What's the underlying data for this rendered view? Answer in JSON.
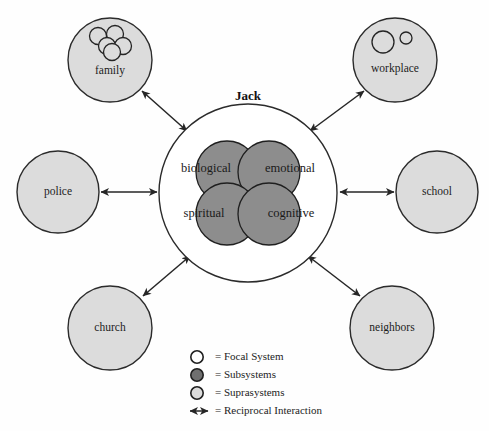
{
  "diagram": {
    "type": "ecomap",
    "focal": {
      "title": "Jack",
      "shape": "circle",
      "fill": "#ffffff",
      "cx": 248,
      "cy": 193,
      "r": 89
    },
    "subsystems": [
      {
        "label": "biological",
        "quadrant": "top-left",
        "cx": 227,
        "cy": 172,
        "r": 31,
        "label_x": 206,
        "label_y": 169
      },
      {
        "label": "emotional",
        "quadrant": "top-right",
        "cx": 269,
        "cy": 172,
        "r": 31,
        "label_x": 290,
        "label_y": 169
      },
      {
        "label": "spiritual",
        "quadrant": "bottom-left",
        "cx": 227,
        "cy": 214,
        "r": 31,
        "label_x": 204,
        "label_y": 214
      },
      {
        "label": "cognitive",
        "quadrant": "bottom-right",
        "cx": 269,
        "cy": 214,
        "r": 31,
        "label_x": 291,
        "label_y": 214
      }
    ],
    "subsystem_fill": "#8d8d8d",
    "suprasystem_fill": "#dcdcdc",
    "suprasystems": [
      {
        "label": "family",
        "cx": 110,
        "cy": 60,
        "r": 42,
        "label_x": 110,
        "label_y": 71,
        "glyph": "five-circle-cluster"
      },
      {
        "label": "workplace",
        "cx": 395,
        "cy": 60,
        "r": 42,
        "label_x": 395,
        "label_y": 69,
        "glyph": "two-circles"
      },
      {
        "label": "police",
        "cx": 58,
        "cy": 192,
        "r": 41,
        "label_x": 58,
        "label_y": 192,
        "glyph": "none"
      },
      {
        "label": "school",
        "cx": 437,
        "cy": 192,
        "r": 41,
        "label_x": 437,
        "label_y": 192,
        "glyph": "none"
      },
      {
        "label": "church",
        "cx": 110,
        "cy": 328,
        "r": 42,
        "label_x": 110,
        "label_y": 328,
        "glyph": "none"
      },
      {
        "label": "neighbors",
        "cx": 392,
        "cy": 328,
        "r": 42,
        "label_x": 392,
        "label_y": 328,
        "glyph": "none"
      }
    ],
    "connections": [
      {
        "from": "focal",
        "to": "family",
        "style": "double-arrow"
      },
      {
        "from": "focal",
        "to": "workplace",
        "style": "double-arrow"
      },
      {
        "from": "focal",
        "to": "police",
        "style": "double-arrow"
      },
      {
        "from": "focal",
        "to": "school",
        "style": "double-arrow"
      },
      {
        "from": "focal",
        "to": "church",
        "style": "double-arrow"
      },
      {
        "from": "focal",
        "to": "neighbors",
        "style": "double-arrow"
      }
    ]
  },
  "legend": {
    "items": [
      {
        "marker": "open-circle",
        "text": "= Focal System"
      },
      {
        "marker": "dark-filled-circle",
        "text": "= Subsystems"
      },
      {
        "marker": "light-filled-circle",
        "text": "= Suprasystems"
      },
      {
        "marker": "double-arrow",
        "text": "= Reciprocal Interaction"
      }
    ]
  }
}
